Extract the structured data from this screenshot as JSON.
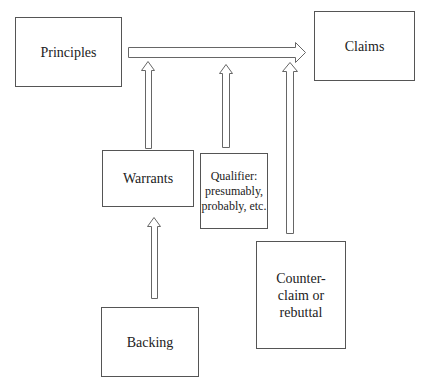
{
  "diagram": {
    "nodes": {
      "principles": {
        "label": "Principles"
      },
      "claims": {
        "label": "Claims"
      },
      "warrants": {
        "label": "Warrants"
      },
      "qualifier": {
        "label": "Qualifier:\npresumably,\nprobably, etc."
      },
      "counterclaim": {
        "label": "Counter-\nclaim or\nrebuttal"
      },
      "backing": {
        "label": "Backing"
      }
    },
    "edges": [
      {
        "from": "principles",
        "to": "claims",
        "style": "hollow-arrow",
        "direction": "right"
      },
      {
        "from": "warrants",
        "to": "principles-claims-arrow",
        "style": "hollow-arrow",
        "direction": "up"
      },
      {
        "from": "qualifier",
        "to": "principles-claims-arrow",
        "style": "hollow-arrow",
        "direction": "up"
      },
      {
        "from": "counterclaim",
        "to": "principles-claims-arrow",
        "style": "hollow-arrow",
        "direction": "up"
      },
      {
        "from": "backing",
        "to": "warrants",
        "style": "hollow-arrow",
        "direction": "up"
      }
    ],
    "colors": {
      "stroke": "#555555",
      "text": "#222222",
      "background": "#ffffff"
    }
  }
}
